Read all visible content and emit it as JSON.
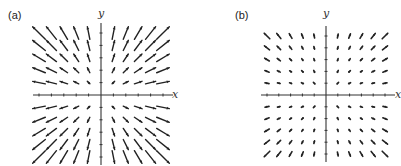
{
  "figure": {
    "panels": [
      {
        "id": "a",
        "label": "(a)",
        "x_axis_label": "x",
        "y_axis_label": "y",
        "description": "Radial vector field pointing outward from origin, long arrows",
        "field": "F(x,y) = x i + y j"
      },
      {
        "id": "b",
        "label": "(b)",
        "x_axis_label": "x",
        "y_axis_label": "y",
        "description": "Outward vector field with short arrows near origin growing toward corners",
        "field": "F(x,y) grows faster away from origin"
      }
    ]
  },
  "chart_data": [
    {
      "type": "vector_field",
      "title": "(a)",
      "xlabel": "x",
      "ylabel": "y",
      "grid": {
        "n_per_side": 5,
        "range": [
          -5,
          5
        ],
        "excludes_axes": true
      },
      "vector_rule": "u = x, v = y",
      "arrow_scale": 0.85,
      "color": "#222222"
    },
    {
      "type": "vector_field",
      "title": "(b)",
      "xlabel": "x",
      "ylabel": "y",
      "grid": {
        "n_per_side": 5,
        "range": [
          -5,
          5
        ],
        "excludes_axes": true
      },
      "vector_rule": "u = x*r/5, v = y*r/5 (magnitude grows with distance)",
      "arrow_scale": 0.28,
      "color": "#222222"
    }
  ]
}
